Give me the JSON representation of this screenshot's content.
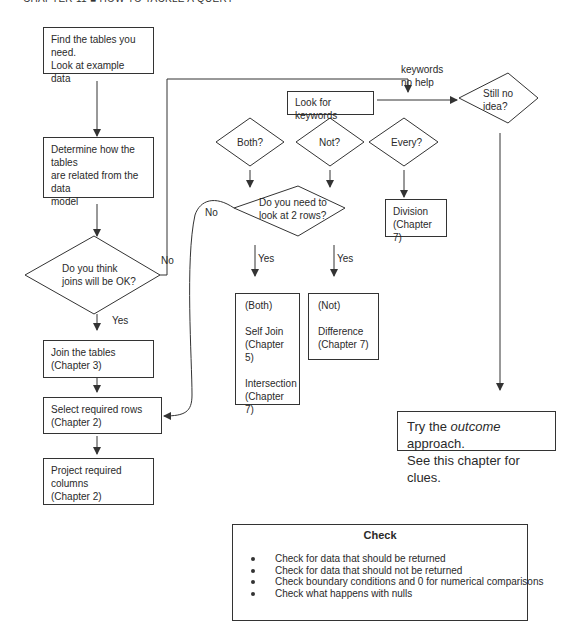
{
  "header": {
    "text": "CHAPTER 11 ■ HOW TO TACKLE A QUERY"
  },
  "boxes": {
    "find_tables": {
      "line1": "Find the tables you need.",
      "line2": "Look at example data"
    },
    "determine": {
      "line1": "Determine how the tables",
      "line2": "are related from the data",
      "line3": "model"
    },
    "join": {
      "line1": "Join the tables",
      "line2": "(Chapter 3)"
    },
    "select": {
      "line1": "Select required rows",
      "line2": "(Chapter 2)"
    },
    "project": {
      "line1": "Project required columns",
      "line2": "(Chapter 2)"
    },
    "keywords": {
      "label": "Look for keywords"
    },
    "division": {
      "line1": "Division",
      "line2": "(Chapter 7)"
    },
    "both_result": {
      "heading": "(Both)",
      "a1": "Self Join",
      "a2": "(Chapter 5)",
      "b1": "Intersection",
      "b2": "(Chapter 7)"
    },
    "not_result": {
      "heading": "(Not)",
      "a1": "Difference",
      "a2": "(Chapter 7)"
    },
    "outcome": {
      "pre": "Try the ",
      "em": "outcome",
      "post": " approach.",
      "line2": "See this chapter for clues."
    }
  },
  "decisions": {
    "joins_ok": {
      "line1": "Do you think",
      "line2": "joins will be OK?"
    },
    "both": {
      "label": "Both?"
    },
    "not": {
      "label": "Not?"
    },
    "every": {
      "label": "Every?"
    },
    "two_rows": {
      "line1": "Do you need to",
      "line2": "look at 2 rows?"
    },
    "still_no_idea": {
      "line1": "Still no",
      "line2": "idea?"
    }
  },
  "edge_labels": {
    "joins_no": "No",
    "joins_yes": "Yes",
    "two_rows_no": "No",
    "both_yes": "Yes",
    "not_yes": "Yes",
    "keywords_no_help_1": "keywords",
    "keywords_no_help_2": "no help"
  },
  "check": {
    "title": "Check",
    "items": [
      "Check for data that should be returned",
      "Check for data that should not be returned",
      "Check boundary conditions and 0 for numerical comparisons",
      "Check what happens with nulls"
    ]
  }
}
